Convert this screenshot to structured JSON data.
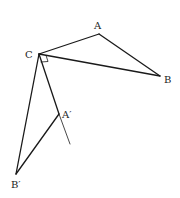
{
  "diagram": {
    "type": "geometry-rotation",
    "points": {
      "A": {
        "label": "A",
        "x": 99,
        "y": 34
      },
      "B": {
        "label": "B",
        "x": 160,
        "y": 76
      },
      "C": {
        "label": "C",
        "x": 39,
        "y": 54
      },
      "A_prime": {
        "label": "A′",
        "x": 59,
        "y": 114
      },
      "B_prime": {
        "label": "B′",
        "x": 16,
        "y": 174
      }
    },
    "segments": [
      {
        "from": "C",
        "to": "A"
      },
      {
        "from": "A",
        "to": "B"
      },
      {
        "from": "C",
        "to": "B"
      },
      {
        "from": "C",
        "to": "B_prime"
      },
      {
        "from": "B_prime",
        "to": "A_prime"
      },
      {
        "from": "C",
        "to": "A_prime",
        "extended_to": {
          "x": 70,
          "y": 144
        }
      }
    ],
    "right_angle_mark_at": "C",
    "stroke_color": "#1a1a1a"
  }
}
